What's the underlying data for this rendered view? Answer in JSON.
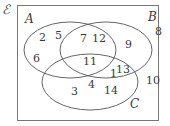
{
  "diagram": {
    "type": "venn",
    "universal_label": "ℰ",
    "sets": {
      "A": {
        "label": "A"
      },
      "B": {
        "label": "B"
      },
      "C": {
        "label": "C"
      }
    },
    "regions": {
      "A_only": [
        "2",
        "5",
        "6"
      ],
      "A_and_B_only": [
        "7",
        "12"
      ],
      "B_only": [
        "9"
      ],
      "A_and_B_and_C": [
        "11"
      ],
      "B_and_C_only": [
        "1",
        "13"
      ],
      "A_and_C_only": [
        "4"
      ],
      "C_only": [
        "3",
        "14"
      ],
      "outside": [
        "8",
        "10"
      ]
    },
    "numbers": {
      "n2": "2",
      "n5": "5",
      "n6": "6",
      "n7": "7",
      "n12": "12",
      "n9": "9",
      "n11": "11",
      "n1": "1",
      "n13": "13",
      "n4": "4",
      "n3": "3",
      "n14": "14",
      "n8": "8",
      "n10": "10"
    },
    "colors": {
      "stroke": "#555555",
      "text": "#3a3a3a"
    }
  }
}
